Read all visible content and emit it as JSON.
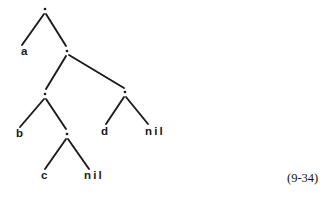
{
  "figure": {
    "kind": "binary-tree-diagram",
    "caption": "(9-34)",
    "width": 332,
    "height": 202,
    "background_color": "#ffffff",
    "ink_color": "#1a1a1a"
  },
  "nodes": [
    {
      "id": "n0",
      "kind": "cons-dot",
      "glyph": ".",
      "x": 45,
      "y": 9
    },
    {
      "id": "n1",
      "kind": "cons-dot",
      "glyph": ".",
      "x": 67,
      "y": 51
    },
    {
      "id": "n2",
      "kind": "cons-dot",
      "glyph": ".",
      "x": 45,
      "y": 94
    },
    {
      "id": "n3",
      "kind": "cons-dot",
      "glyph": ".",
      "x": 125,
      "y": 92
    },
    {
      "id": "n4",
      "kind": "cons-dot",
      "glyph": ".",
      "x": 67,
      "y": 134
    }
  ],
  "leaves": [
    {
      "id": "la",
      "label": "a",
      "x": 21,
      "y": 46,
      "style": "atom"
    },
    {
      "id": "lb",
      "label": "b",
      "x": 16,
      "y": 128,
      "style": "atom"
    },
    {
      "id": "ld",
      "label": "d",
      "x": 101,
      "y": 126,
      "style": "atom"
    },
    {
      "id": "lnil1",
      "label": "nil",
      "x": 145,
      "y": 126,
      "style": "word"
    },
    {
      "id": "lc",
      "label": "c",
      "x": 41,
      "y": 170,
      "style": "atom"
    },
    {
      "id": "lnil2",
      "label": "nil",
      "x": 84,
      "y": 170,
      "style": "word"
    }
  ],
  "edges": [
    {
      "from": "n0",
      "to": "la",
      "x1": 44,
      "y1": 14,
      "x2": 22,
      "y2": 45
    },
    {
      "from": "n0",
      "to": "n1",
      "x1": 46,
      "y1": 14,
      "x2": 66,
      "y2": 46
    },
    {
      "from": "n1",
      "to": "n2",
      "x1": 66,
      "y1": 56,
      "x2": 46,
      "y2": 89
    },
    {
      "from": "n1",
      "to": "n3",
      "x1": 69,
      "y1": 55,
      "x2": 124,
      "y2": 88
    },
    {
      "from": "n2",
      "to": "lb",
      "x1": 44,
      "y1": 99,
      "x2": 20,
      "y2": 127
    },
    {
      "from": "n2",
      "to": "n4",
      "x1": 46,
      "y1": 99,
      "x2": 66,
      "y2": 129
    },
    {
      "from": "n3",
      "to": "ld",
      "x1": 124,
      "y1": 97,
      "x2": 106,
      "y2": 124
    },
    {
      "from": "n3",
      "to": "lnil1",
      "x1": 126,
      "y1": 97,
      "x2": 148,
      "y2": 124
    },
    {
      "from": "n4",
      "to": "lc",
      "x1": 66,
      "y1": 139,
      "x2": 45,
      "y2": 169
    },
    {
      "from": "n4",
      "to": "lnil2",
      "x1": 68,
      "y1": 139,
      "x2": 89,
      "y2": 169
    }
  ],
  "caption": {
    "text": "(9-34)",
    "x": 287,
    "y": 172
  }
}
